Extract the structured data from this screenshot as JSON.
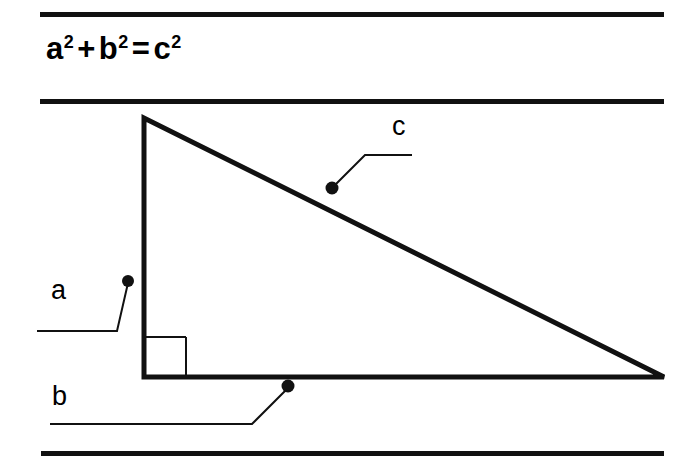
{
  "page": {
    "background_color": "#ffffff",
    "ink_color": "#111111",
    "width": 685,
    "height": 465
  },
  "title": {
    "full_text": "a2 + b2 = c2",
    "plain_text": "a² + b² = c²",
    "terms": {
      "a_base": "a",
      "a_exponent": "2",
      "plus": "+",
      "b_base": "b",
      "b_exponent": "2",
      "equals": "=",
      "c_base": "c",
      "c_exponent": "2"
    }
  },
  "rules": {
    "top_label": "horizontal-rule-top",
    "middle_label": "horizontal-rule-under-title",
    "bottom_label": "horizontal-rule-bottom"
  },
  "figure": {
    "name": "right-triangle-diagram",
    "triangle": {
      "apex": [
        144,
        118
      ],
      "right_angle_vertex": [
        144,
        377
      ],
      "far_vertex": [
        664,
        377
      ],
      "stroke_width": 5
    },
    "right_angle_marker": {
      "x": 146,
      "y": 337,
      "size": 40,
      "stroke_width": 2
    },
    "labels": [
      {
        "id": "a",
        "text": "a",
        "meaning": "vertical leg",
        "dot": [
          128,
          281
        ],
        "leader": "M50,424"
      },
      {
        "id": "b",
        "text": "b",
        "meaning": "horizontal leg",
        "dot": [
          288,
          386
        ]
      },
      {
        "id": "c",
        "text": "c",
        "meaning": "hypotenuse",
        "dot": [
          332,
          188
        ]
      }
    ]
  }
}
